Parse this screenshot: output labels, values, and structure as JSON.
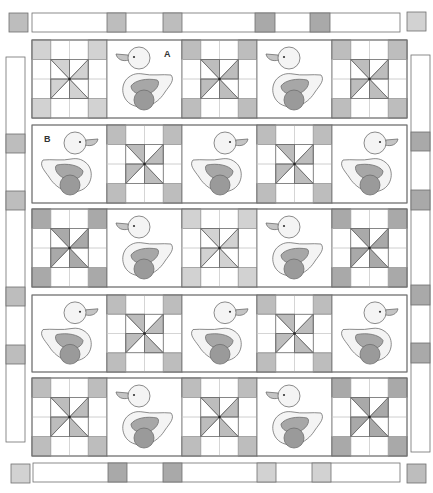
{
  "diagram": {
    "labels": [
      {
        "text": "A",
        "block": "row1-col2"
      },
      {
        "text": "B",
        "block": "row2-col1"
      }
    ],
    "colors": {
      "background": "#ffffff",
      "outline": "#6f6f6f",
      "light": "#d2d2d2",
      "medium": "#bdbdbd",
      "dark": "#a9a9a9",
      "duck_body": "#f4f4f4",
      "duck_wing": "#a7a7a7",
      "duck_wheel": "#9a9a9a",
      "duck_beak": "#c4c4c4"
    },
    "layout": {
      "columns_x": [
        32,
        107,
        182,
        257,
        332,
        407
      ],
      "rows": [
        {
          "y": 40,
          "h": 78
        },
        {
          "y": 125,
          "h": 78
        },
        {
          "y": 209,
          "h": 78
        },
        {
          "y": 295,
          "h": 77
        },
        {
          "y": 378,
          "h": 78
        }
      ]
    },
    "rows": [
      {
        "name": "row-1",
        "blocks": [
          {
            "type": "pinwheel",
            "shade": "light"
          },
          {
            "type": "duck",
            "facing": "left",
            "label": "A"
          },
          {
            "type": "pinwheel",
            "shade": "medium"
          },
          {
            "type": "duck",
            "facing": "left"
          },
          {
            "type": "pinwheel",
            "shade": "medium"
          }
        ]
      },
      {
        "name": "row-2",
        "blocks": [
          {
            "type": "duck",
            "facing": "right",
            "label": "B"
          },
          {
            "type": "pinwheel",
            "shade": "medium"
          },
          {
            "type": "duck",
            "facing": "right"
          },
          {
            "type": "pinwheel",
            "shade": "medium"
          },
          {
            "type": "duck",
            "facing": "right"
          }
        ]
      },
      {
        "name": "row-3",
        "blocks": [
          {
            "type": "pinwheel",
            "shade": "dark"
          },
          {
            "type": "duck",
            "facing": "left"
          },
          {
            "type": "pinwheel",
            "shade": "light"
          },
          {
            "type": "duck",
            "facing": "left"
          },
          {
            "type": "pinwheel",
            "shade": "dark"
          }
        ]
      },
      {
        "name": "row-4",
        "blocks": [
          {
            "type": "duck",
            "facing": "right"
          },
          {
            "type": "pinwheel",
            "shade": "medium"
          },
          {
            "type": "duck",
            "facing": "right"
          },
          {
            "type": "pinwheel",
            "shade": "medium"
          },
          {
            "type": "duck",
            "facing": "right"
          }
        ]
      },
      {
        "name": "row-5",
        "blocks": [
          {
            "type": "pinwheel",
            "shade": "medium"
          },
          {
            "type": "duck",
            "facing": "left"
          },
          {
            "type": "pinwheel",
            "shade": "medium"
          },
          {
            "type": "duck",
            "facing": "left"
          },
          {
            "type": "pinwheel",
            "shade": "dark"
          }
        ]
      }
    ],
    "borders": {
      "top": {
        "x": 32,
        "y": 13,
        "w": 368,
        "h": 19,
        "segments": [
          {
            "from": 107,
            "to": 126,
            "shade": "medium"
          },
          {
            "from": 163,
            "to": 182,
            "shade": "medium"
          },
          {
            "from": 255,
            "to": 275,
            "shade": "dark"
          },
          {
            "from": 310,
            "to": 330,
            "shade": "dark"
          }
        ]
      },
      "bottom": {
        "x": 33,
        "y": 463,
        "w": 367,
        "h": 19,
        "segments": [
          {
            "from": 108,
            "to": 127,
            "shade": "dark"
          },
          {
            "from": 163,
            "to": 182,
            "shade": "dark"
          },
          {
            "from": 257,
            "to": 276,
            "shade": "light"
          },
          {
            "from": 312,
            "to": 331,
            "shade": "light"
          }
        ]
      },
      "left": {
        "x": 6,
        "y": 57,
        "w": 19,
        "h": 385,
        "segments": [
          {
            "from": 134,
            "to": 153,
            "shade": "medium"
          },
          {
            "from": 191,
            "to": 210,
            "shade": "medium"
          },
          {
            "from": 287,
            "to": 306,
            "shade": "medium"
          },
          {
            "from": 345,
            "to": 364,
            "shade": "medium"
          }
        ]
      },
      "right": {
        "x": 411,
        "y": 55,
        "w": 19,
        "h": 397,
        "segments": [
          {
            "from": 132,
            "to": 151,
            "shade": "dark"
          },
          {
            "from": 190,
            "to": 210,
            "shade": "dark"
          },
          {
            "from": 285,
            "to": 305,
            "shade": "dark"
          },
          {
            "from": 343,
            "to": 363,
            "shade": "dark"
          }
        ]
      }
    },
    "corner_squares": [
      {
        "name": "top-left",
        "x": 9,
        "y": 13,
        "size": 19,
        "shade": "medium"
      },
      {
        "name": "top-right",
        "x": 407,
        "y": 12,
        "size": 19,
        "shade": "light"
      },
      {
        "name": "bottom-left",
        "x": 11,
        "y": 464,
        "size": 19,
        "shade": "light"
      },
      {
        "name": "bottom-right",
        "x": 407,
        "y": 464,
        "size": 19,
        "shade": "medium"
      }
    ]
  }
}
